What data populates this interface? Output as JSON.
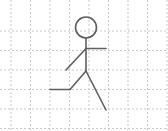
{
  "canvas": {
    "width": 168,
    "height": 131,
    "background_color": "#ffffff",
    "title": "Stick figure walking on dashed grid"
  },
  "grid": {
    "line_color": "#c9c9c9",
    "line_width": 1,
    "dash_pattern": "2 2",
    "origin_x": 11,
    "origin_y": 31,
    "spacing_x": 19.5,
    "spacing_y": 19.5,
    "vertical_lines_x": [
      11,
      30.5,
      50,
      69.5,
      89,
      108.5,
      128,
      147.5,
      167
    ],
    "horizontal_lines_y": [
      31,
      50.5,
      70,
      89.5,
      109,
      128.5
    ],
    "grid_enabled": true
  },
  "figure": {
    "name": "stick-figure",
    "stroke_color": "#5f5f5f",
    "stroke_width": 1.6,
    "head": {
      "name": "head-circle",
      "center_x": 86,
      "center_y": 27.5,
      "radius": 10.5
    },
    "spine": {
      "name": "torso-line",
      "x1": 86,
      "y1": 38,
      "x2": 86,
      "y2": 71
    },
    "arm_forward": {
      "name": "right-arm",
      "x1": 86,
      "y1": 48.5,
      "x2": 106,
      "y2": 48.5
    },
    "arm_back": {
      "name": "left-arm",
      "x1": 86,
      "y1": 48.5,
      "x2": 66,
      "y2": 70
    },
    "leg_forward": {
      "name": "left-leg-thigh-shin",
      "x1": 86,
      "y1": 71,
      "x2": 70,
      "y2": 89.5
    },
    "foot_forward": {
      "name": "left-foot",
      "x1": 70,
      "y1": 89.5,
      "x2": 50,
      "y2": 89.5
    },
    "leg_back": {
      "name": "right-leg",
      "x1": 86,
      "y1": 71,
      "x2": 106,
      "y2": 110
    }
  },
  "labels": {
    "figure_caption": "",
    "grid_caption": ""
  }
}
